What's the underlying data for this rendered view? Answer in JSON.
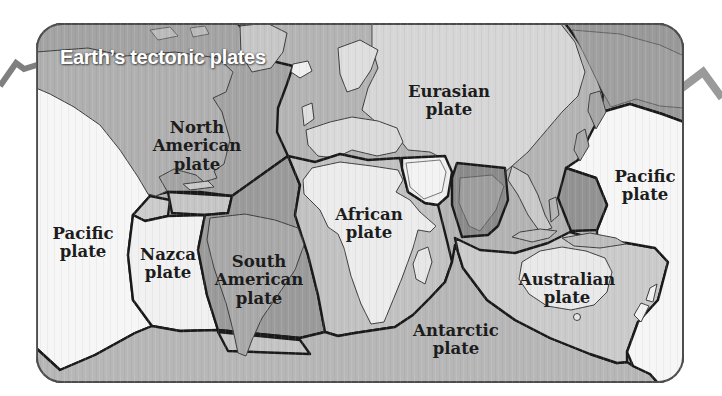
{
  "title": "Earth’s tectonic plates",
  "plates": {
    "north_american": {
      "label": "North\nAmerican\nplate"
    },
    "eurasian": {
      "label": "Eurasian\nplate"
    },
    "pacific_west": {
      "label": "Pacific\nplate"
    },
    "pacific_east": {
      "label": "Pacific\nplate"
    },
    "nazca": {
      "label": "Nazca\nplate"
    },
    "south_american": {
      "label": "South\nAmerican\nplate"
    },
    "african": {
      "label": "African\nplate"
    },
    "australian": {
      "label": "Australian\nplate"
    },
    "antarctic": {
      "label": "Antarctic\nplate"
    }
  },
  "colors": {
    "ink": "#1c1c1c",
    "title_text": "#ffffff",
    "boundary": "#1a1a1a",
    "pacific": "#f6f6f6",
    "nazca": "#f1f1f1",
    "north_american": "#a4a4a4",
    "ne_siberia": "#9a9a9a",
    "eurasian_ocean": "#b4b4b4",
    "asia_land": "#d6d6d6",
    "african_ocean": "#c2c2c2",
    "africa_land": "#ececec",
    "arabian": "#f0f0f0",
    "indian": "#8b8b8b",
    "philippine": "#939393",
    "south_american": "#9b9b9b",
    "caribbean": "#c6c6c6",
    "cocos": "#cccccc",
    "scotia": "#c4c4c4",
    "antarctic": "#b7b7b7",
    "australian": "#cbcbcb",
    "australia_land": "#e9e9e9",
    "zigzag_left": "#7f7f7f",
    "zigzag_right": "#9a9a9a"
  }
}
